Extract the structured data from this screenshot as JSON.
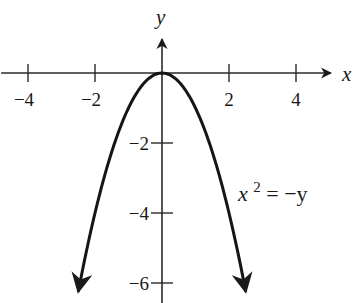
{
  "chart_data": {
    "type": "line",
    "title": "",
    "xlabel": "x",
    "ylabel": "y",
    "xlim": [
      -4.8,
      5.0
    ],
    "ylim": [
      -6.5,
      1.9
    ],
    "grid": false,
    "x_ticks": [
      -4,
      -2,
      2,
      4
    ],
    "x_tick_labels": [
      "−4",
      "−2",
      "2",
      "4"
    ],
    "y_ticks": [
      -2,
      -4,
      -6
    ],
    "y_tick_labels": [
      "−2",
      "−4",
      "−6"
    ],
    "series": [
      {
        "name": "x^2 = -y",
        "equation": "y = -x^2",
        "x_range": [
          -2.5,
          2.5
        ],
        "arrows_at_ends": true,
        "points": [
          {
            "x": -2.5,
            "y": -6.25
          },
          {
            "x": -2,
            "y": -4
          },
          {
            "x": -1,
            "y": -1
          },
          {
            "x": 0,
            "y": 0
          },
          {
            "x": 1,
            "y": -1
          },
          {
            "x": 2,
            "y": -4
          },
          {
            "x": 2.5,
            "y": -6.25
          }
        ]
      }
    ],
    "annotations": [
      {
        "text_base": "x",
        "text_sup": "2",
        "text_rest": " = −y",
        "near": "right of curve, around y = -3.5"
      }
    ]
  }
}
